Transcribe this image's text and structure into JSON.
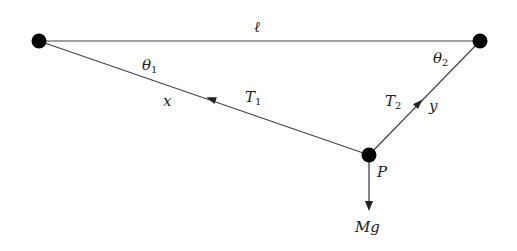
{
  "diagram": {
    "colors": {
      "line": "#444444",
      "dot": "#000000",
      "text": "#222222",
      "background": "#ffffff"
    },
    "points": {
      "left_support": {
        "x": 39,
        "y": 41
      },
      "right_support": {
        "x": 480,
        "y": 41
      },
      "P": {
        "x": 369,
        "y": 155,
        "label": "P"
      }
    },
    "labels": {
      "length": "ℓ",
      "theta1": {
        "symbol": "θ",
        "sub": "1"
      },
      "theta2": {
        "symbol": "θ",
        "sub": "2"
      },
      "x": "x",
      "y": "y",
      "T1": {
        "symbol": "T",
        "sub": "1"
      },
      "T2": {
        "symbol": "T",
        "sub": "2"
      },
      "weight": "Mg",
      "point": "P"
    },
    "segments": [
      {
        "name": "top-line",
        "from": "left_support",
        "to": "right_support",
        "label": "ℓ"
      },
      {
        "name": "string-x",
        "from": "left_support",
        "to": "P",
        "label": "x",
        "tension": "T1"
      },
      {
        "name": "string-y",
        "from": "right_support",
        "to": "P",
        "label": "y",
        "tension": "T2"
      }
    ]
  }
}
